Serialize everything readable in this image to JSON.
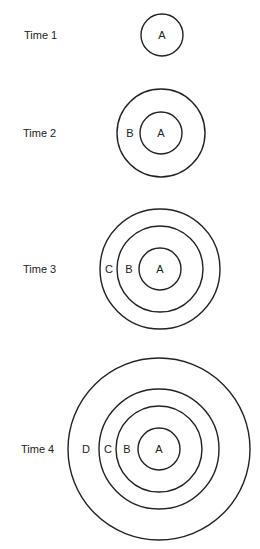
{
  "diagram": {
    "stroke_color": "#222222",
    "background": "#ffffff",
    "stages": [
      {
        "label": "Time 1",
        "label_x": 24,
        "cy": 35,
        "cx": 162,
        "rings": [
          {
            "name": "A",
            "r": 21,
            "label_x": 162
          }
        ]
      },
      {
        "label": "Time 2",
        "label_x": 23,
        "cy": 133,
        "cx": 161,
        "rings": [
          {
            "name": "A",
            "r": 21,
            "label_x": 161
          },
          {
            "name": "B",
            "r": 44,
            "label_x": 130
          }
        ]
      },
      {
        "label": "Time 3",
        "label_x": 23,
        "cy": 269,
        "cx": 160,
        "rings": [
          {
            "name": "A",
            "r": 21,
            "label_x": 160
          },
          {
            "name": "B",
            "r": 43,
            "label_x": 129
          },
          {
            "name": "C",
            "r": 60,
            "label_x": 109
          }
        ]
      },
      {
        "label": "Time 4",
        "label_x": 21,
        "cy": 449,
        "cx": 159,
        "rings": [
          {
            "name": "A",
            "r": 21,
            "label_x": 159
          },
          {
            "name": "B",
            "r": 43,
            "label_x": 127
          },
          {
            "name": "C",
            "r": 60,
            "label_x": 108
          },
          {
            "name": "D",
            "r": 91,
            "label_x": 86
          }
        ]
      }
    ]
  }
}
